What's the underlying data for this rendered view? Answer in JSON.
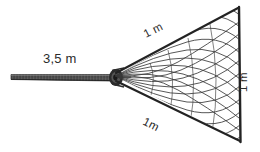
{
  "figure": {
    "background_color": "#ffffff",
    "line_color": "#2b2b2b",
    "handle_color": "#4a4a4a",
    "mesh_color": "#3a3a3a"
  },
  "labels": {
    "handle_length": "3,5 m",
    "top_edge_length": "1 m",
    "bottom_edge_length": "1m",
    "opening_height": "1 m"
  },
  "parts": {
    "handle_name": "handle",
    "net_name": "net",
    "apex_name": "apex-knot",
    "rim_name": "opening-rim"
  }
}
